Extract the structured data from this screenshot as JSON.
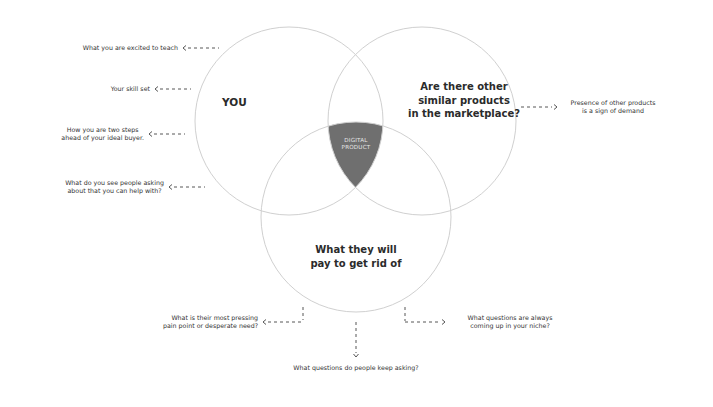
{
  "diagram": {
    "type": "venn",
    "colors": {
      "background": "#ffffff",
      "circle_stroke": "#d0d0d0",
      "intersection_fill": "#6f6f6f",
      "text": "#2b2b2b",
      "intersection_text": "#e6e6e6"
    },
    "circles": [
      {
        "id": "you",
        "label": "YOU",
        "cx": 289,
        "cy": 121,
        "r": 94
      },
      {
        "id": "marketplace",
        "label_lines": [
          "Are there other",
          "similar products",
          "in the marketplace?"
        ],
        "cx": 422,
        "cy": 121,
        "r": 94
      },
      {
        "id": "pain",
        "label_lines": [
          "What they will",
          "pay to get rid of"
        ],
        "cx": 356,
        "cy": 217,
        "r": 95
      }
    ],
    "intersection": {
      "label_lines": [
        "DIGITAL",
        "PRODUCT"
      ]
    },
    "left_notes": [
      {
        "lines": [
          "What you are excited to teach"
        ]
      },
      {
        "lines": [
          "Your skill set"
        ]
      },
      {
        "lines": [
          "How you are two steps",
          "ahead of your ideal buyer."
        ]
      },
      {
        "lines": [
          "What do you see people asking",
          "about that you can help with?"
        ]
      }
    ],
    "right_note": {
      "lines": [
        "Presence of other products",
        "is a sign of demand"
      ]
    },
    "bottom_notes": {
      "left": {
        "lines": [
          "What is their most pressing",
          "pain point or desperate need?"
        ]
      },
      "center": {
        "lines": [
          "What questions do people keep asking?"
        ]
      },
      "right": {
        "lines": [
          "What questions are always",
          "coming up in your niche?"
        ]
      }
    }
  }
}
